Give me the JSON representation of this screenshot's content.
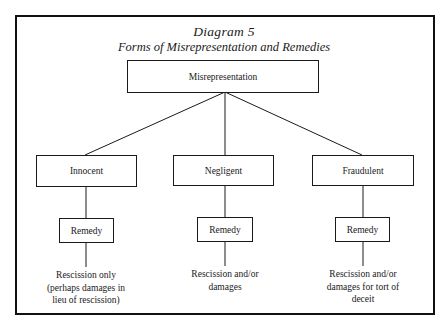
{
  "diagram": {
    "title": "Diagram 5",
    "subtitle": "Forms of Misrepresentation and Remedies",
    "root": {
      "label": "Misrepresentation"
    },
    "branches": [
      {
        "type": "Innocent",
        "remedy_label": "Remedy",
        "outcome_lines": [
          "Rescission only",
          "(perhaps damages in",
          "lieu of rescission)"
        ]
      },
      {
        "type": "Negligent",
        "remedy_label": "Remedy",
        "outcome_lines": [
          "Rescission and/or",
          "damages"
        ]
      },
      {
        "type": "Fraudulent",
        "remedy_label": "Remedy",
        "outcome_lines": [
          "Rescission and/or",
          "damages for tort of",
          "deceit"
        ]
      }
    ],
    "colors": {
      "line": "#1a1a1a",
      "frame": "#111111",
      "background": "#ffffff"
    }
  }
}
